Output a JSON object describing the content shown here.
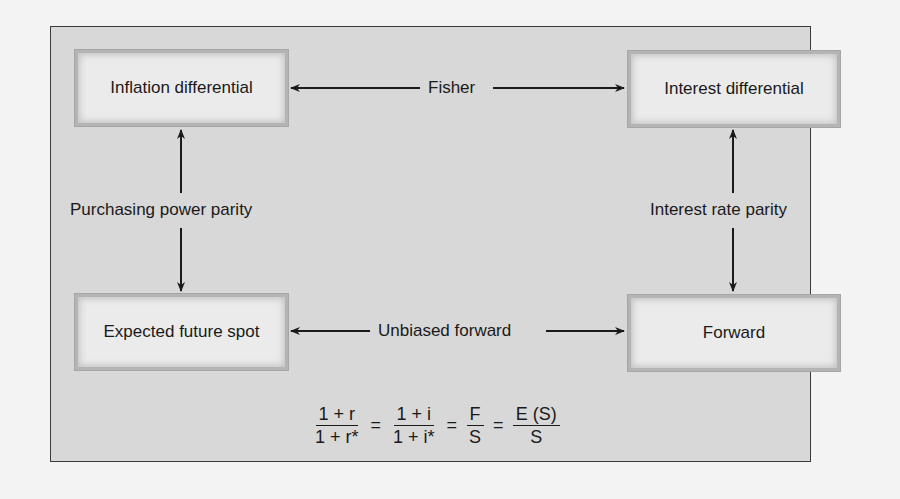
{
  "diagram": {
    "nodes": {
      "top_left": "Inflation differential",
      "top_right": "Interest differential",
      "bottom_left": "Expected future spot",
      "bottom_right": "Forward"
    },
    "edges": {
      "top": "Fisher",
      "left": "Purchasing power parity",
      "right": "Interest rate parity",
      "bottom": "Unbiased forward"
    },
    "formula": {
      "term1": {
        "num": "1 + r",
        "den": "1 + r*"
      },
      "term2": {
        "num": "1 + i",
        "den": "1 + i*"
      },
      "term3": {
        "num": "F",
        "den": "S"
      },
      "term4": {
        "num": "E (S)",
        "den": "S"
      },
      "equals": "="
    }
  },
  "colors": {
    "frame_bg": "#d8d8d8",
    "node_bg": "#ebebeb",
    "page_bg": "#f3f3f3",
    "line": "#1a1a1a"
  }
}
